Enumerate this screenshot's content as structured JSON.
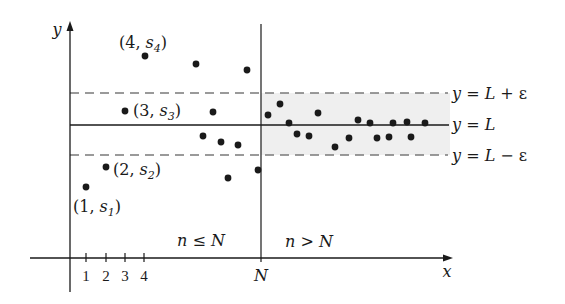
{
  "colors": {
    "ink": "#1a1a1a",
    "dashed": "#7a7a7a",
    "band_fill": "#efefef",
    "background": "#ffffff"
  },
  "axes": {
    "x_label": "x",
    "y_label": "y",
    "ticks": [
      "1",
      "2",
      "3",
      "4"
    ],
    "N_label": "N"
  },
  "regions": {
    "left": {
      "n": "n",
      "op": " ≤ ",
      "N": "N"
    },
    "right": {
      "n": "n",
      "op": " > ",
      "N": "N"
    }
  },
  "lines": {
    "upper": {
      "y": "y",
      "eq": " = ",
      "L": "L",
      "rest": " + ε"
    },
    "middle": {
      "y": "y",
      "eq": " = ",
      "L": "L"
    },
    "lower": {
      "y": "y",
      "eq": " = ",
      "L": "L",
      "rest": " − ε"
    }
  },
  "point_labels": [
    {
      "open": "(4, ",
      "var": "s",
      "sub": "4",
      "close": ")"
    },
    {
      "open": "(3, ",
      "var": "s",
      "sub": "3",
      "close": ")"
    },
    {
      "open": "(2, ",
      "var": "s",
      "sub": "2",
      "close": ")"
    },
    {
      "open": "(1, ",
      "var": "s",
      "sub": "1",
      "close": ")"
    }
  ],
  "diagram": {
    "points_left": [
      [
        86,
        187
      ],
      [
        106,
        167
      ],
      [
        125,
        111
      ],
      [
        145,
        56
      ],
      [
        196,
        64
      ],
      [
        247,
        70
      ],
      [
        213,
        112
      ],
      [
        203,
        136
      ],
      [
        221,
        142
      ],
      [
        238,
        145
      ],
      [
        228,
        178
      ],
      [
        258,
        170
      ]
    ],
    "points_right": [
      [
        268,
        115
      ],
      [
        280,
        104
      ],
      [
        289,
        123
      ],
      [
        297,
        134
      ],
      [
        309,
        136
      ],
      [
        318,
        113
      ],
      [
        335,
        147
      ],
      [
        349,
        138
      ],
      [
        358,
        120
      ],
      [
        370,
        123
      ],
      [
        377,
        138
      ],
      [
        389,
        137
      ],
      [
        393,
        123
      ],
      [
        407,
        122
      ],
      [
        411,
        137
      ],
      [
        425,
        123
      ]
    ]
  }
}
